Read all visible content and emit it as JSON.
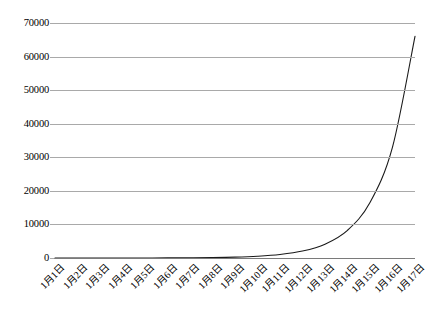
{
  "chart_data": {
    "type": "line",
    "title": "",
    "subtitle": "",
    "xlabel": "",
    "ylabel": "",
    "grid": true,
    "legend": false,
    "legend_position": "none",
    "xlim": [
      1,
      17
    ],
    "ylim": [
      0,
      70000
    ],
    "ytick_step": 10000,
    "line_color": "#1a1a1a",
    "grid_color": "#a9a9a9",
    "background_color": "#ffffff",
    "categories": [
      "1月1日",
      "1月2日",
      "1月3日",
      "1月4日",
      "1月5日",
      "1月6日",
      "1月7日",
      "1月8日",
      "1月9日",
      "1月10日",
      "1月11日",
      "1月12日",
      "1月13日",
      "1月14日",
      "1月15日",
      "1月16日",
      "1月17日"
    ],
    "values": [
      1,
      2,
      4,
      8,
      16,
      32,
      64,
      129,
      258,
      516,
      1032,
      2064,
      4128,
      8256,
      16512,
      33024,
      66048
    ],
    "ytick_labels": [
      "0",
      "10000",
      "20000",
      "30000",
      "40000",
      "50000",
      "60000",
      "70000"
    ],
    "ytick_values": [
      0,
      10000,
      20000,
      30000,
      40000,
      50000,
      60000,
      70000
    ]
  }
}
